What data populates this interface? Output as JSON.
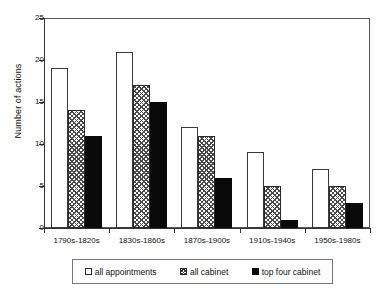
{
  "chart_data": {
    "type": "bar",
    "title": "",
    "subtitle": "",
    "xlabel": "",
    "ylabel": "Number of actions",
    "ylim": [
      0,
      25
    ],
    "yticks": [
      0,
      5,
      10,
      15,
      20,
      25
    ],
    "grid": false,
    "legend_position": "bottom",
    "categories": [
      "1790s-1820s",
      "1830s-1860s",
      "1870s-1900s",
      "1910s-1940s",
      "1950s-1980s"
    ],
    "series": [
      {
        "name": "all appointments",
        "style": "open",
        "values": [
          19,
          21,
          12,
          9,
          7
        ]
      },
      {
        "name": "all cabinet",
        "style": "hatched",
        "values": [
          14,
          17,
          11,
          5,
          5
        ]
      },
      {
        "name": "top four cabinet",
        "style": "solid",
        "values": [
          11,
          15,
          6,
          1,
          3
        ]
      }
    ]
  },
  "axes": {
    "y_title": "Number of actions",
    "y_tick_labels": [
      "0",
      "5",
      "10",
      "15",
      "20",
      "25"
    ],
    "x_tick_labels": [
      "1790s-1820s",
      "1830s-1860s",
      "1870s-1900s",
      "1910s-1940s",
      "1950s-1980s"
    ]
  },
  "legend": {
    "items": [
      {
        "label": "all appointments",
        "swatch": "open-square-swatch"
      },
      {
        "label": "all cabinet",
        "swatch": "hatched-square-swatch"
      },
      {
        "label": "top four cabinet",
        "swatch": "filled-square-swatch"
      }
    ]
  },
  "colors": {
    "bar_open": "#ffffff",
    "bar_hatch": "#4a4a4a",
    "bar_solid": "#0a0a0a",
    "axis": "#333333",
    "frame": "#555555",
    "text": "#111111"
  }
}
